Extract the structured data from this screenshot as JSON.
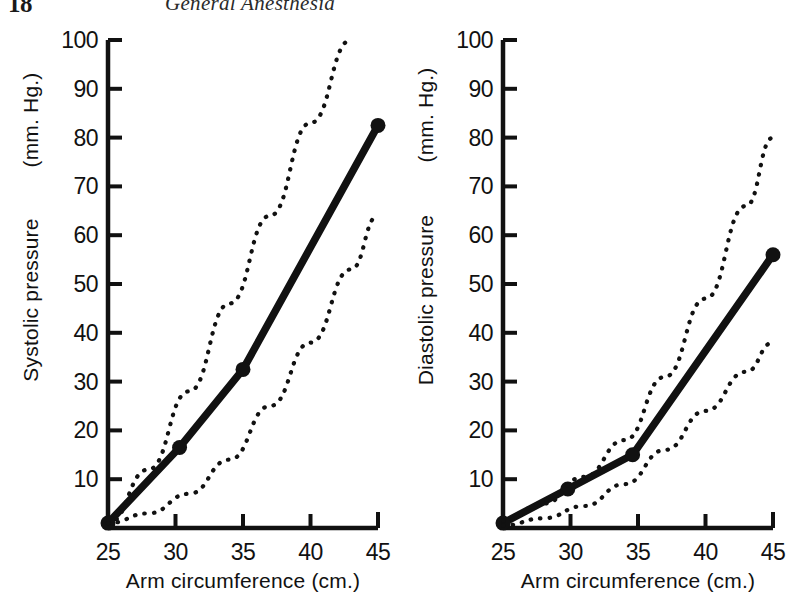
{
  "page": {
    "folio": "18",
    "running_head": "General Anesthesia"
  },
  "chart_data": [
    {
      "id": "systolic",
      "type": "line",
      "title": "",
      "xlabel": "Arm circumference (cm.)",
      "ylabel": "Systolic pressure",
      "yunit": "(mm. Hg.)",
      "xlim": [
        25,
        45
      ],
      "ylim": [
        0,
        100
      ],
      "xticks": [
        25,
        30,
        35,
        40,
        45
      ],
      "xticklabels": [
        "25",
        "30",
        "35",
        "40",
        "45"
      ],
      "yticks": [
        10,
        20,
        30,
        40,
        50,
        60,
        70,
        80,
        90,
        100
      ],
      "yticklabels": [
        "10",
        "20",
        "30",
        "40",
        "50",
        "60",
        "70",
        "80",
        "90",
        "100"
      ],
      "grid": false,
      "legend": "none",
      "series": [
        {
          "name": "mean",
          "style": "solid-thick",
          "markers": true,
          "x": [
            25,
            30.3,
            35,
            45
          ],
          "y": [
            1,
            16.5,
            32.5,
            82.5
          ]
        },
        {
          "name": "upper limit",
          "style": "dotted",
          "markers": false,
          "x": [
            25,
            28,
            31,
            34,
            37,
            40,
            43
          ],
          "y": [
            1,
            12,
            28,
            46,
            64,
            83,
            100
          ]
        },
        {
          "name": "lower limit",
          "style": "dotted",
          "markers": false,
          "x": [
            25,
            28,
            31,
            34,
            37,
            40,
            43,
            45
          ],
          "y": [
            1,
            3,
            7,
            14,
            25,
            38,
            53,
            64
          ]
        }
      ]
    },
    {
      "id": "diastolic",
      "type": "line",
      "title": "",
      "xlabel": "Arm circumference (cm.)",
      "ylabel": "Diastolic pressure",
      "yunit": "(mm. Hg.)",
      "xlim": [
        25,
        45
      ],
      "ylim": [
        0,
        100
      ],
      "xticks": [
        25,
        30,
        35,
        40,
        45
      ],
      "xticklabels": [
        "25",
        "30",
        "35",
        "40",
        "45"
      ],
      "yticks": [
        10,
        20,
        30,
        40,
        50,
        60,
        70,
        80,
        90,
        100
      ],
      "yticklabels": [
        "10",
        "20",
        "30",
        "40",
        "50",
        "60",
        "70",
        "80",
        "90",
        "100"
      ],
      "grid": false,
      "legend": "none",
      "series": [
        {
          "name": "mean",
          "style": "solid-thick",
          "markers": true,
          "x": [
            25,
            29.8,
            34.6,
            45
          ],
          "y": [
            1,
            8,
            15,
            56
          ]
        },
        {
          "name": "upper limit",
          "style": "dotted",
          "markers": false,
          "x": [
            25,
            28,
            31,
            34,
            37,
            40,
            43,
            45
          ],
          "y": [
            1.5,
            5,
            10.5,
            18,
            31,
            47,
            66,
            80
          ]
        },
        {
          "name": "lower limit",
          "style": "dotted",
          "markers": false,
          "x": [
            25,
            28,
            31,
            34,
            37,
            40,
            43,
            45
          ],
          "y": [
            0.5,
            2,
            4.5,
            9,
            16,
            24,
            32,
            38
          ]
        }
      ]
    }
  ],
  "colors": {
    "ink": "#111111",
    "paper": "#ffffff"
  }
}
